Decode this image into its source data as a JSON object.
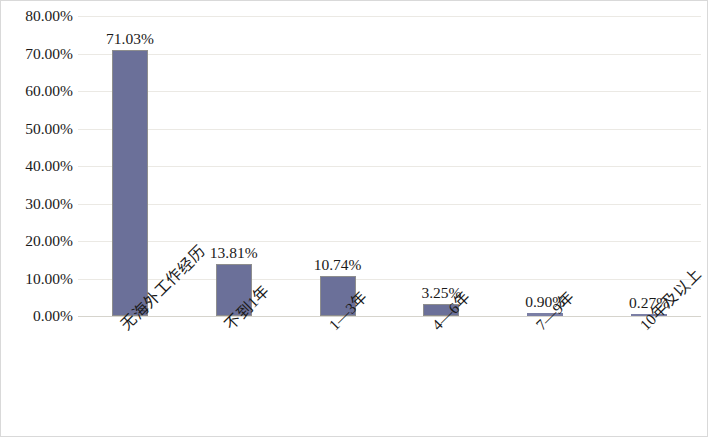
{
  "chart_data": {
    "type": "bar",
    "title": "",
    "subtitle": "",
    "xlabel": "",
    "ylabel": "",
    "categories": [
      "无海外工作经历",
      "不到1年",
      "1—3年",
      "4—6年",
      "7—9年",
      "10年及以上"
    ],
    "values": [
      71.03,
      13.81,
      10.74,
      3.25,
      0.9,
      0.27
    ],
    "value_labels": [
      "71.03%",
      "13.81%",
      "10.74%",
      "3.25%",
      "0.90%",
      "0.27%"
    ],
    "ylim": [
      0,
      80
    ],
    "ytick_values": [
      0,
      10,
      20,
      30,
      40,
      50,
      60,
      70,
      80
    ],
    "ytick_labels": [
      "0.00%",
      "10.00%",
      "20.00%",
      "30.00%",
      "40.00%",
      "50.00%",
      "60.00%",
      "70.00%",
      "80.00%"
    ],
    "grid": true,
    "legend": false,
    "legend_position": "none",
    "series": [
      {
        "name": "",
        "values": [
          71.03,
          13.81,
          10.74,
          3.25,
          0.9,
          0.27
        ]
      }
    ],
    "colors": {
      "bar_fill": "#6b7099",
      "bar_stroke": "#8e8e8e",
      "gridline": "#ebe9e4",
      "baseline": "#d6d4cd",
      "text": "#1a1a1a",
      "background": "#ffffff",
      "frame_border": "#d9d9d9"
    }
  }
}
